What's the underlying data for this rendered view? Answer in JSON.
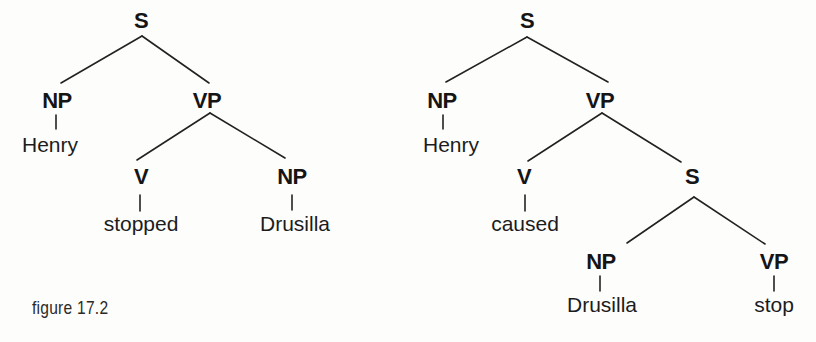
{
  "figure": {
    "caption": "figure 17.2"
  },
  "trees": [
    {
      "id": "left-tree",
      "nodes": {
        "s": {
          "label": "S"
        },
        "np": {
          "label": "NP"
        },
        "np_word": {
          "label": "Henry"
        },
        "vp": {
          "label": "VP"
        },
        "v": {
          "label": "V"
        },
        "v_word": {
          "label": "stopped"
        },
        "obj_np": {
          "label": "NP"
        },
        "obj_np_word": {
          "label": "Drusilla"
        }
      },
      "structure": "[S [NP Henry] [VP [V stopped] [NP Drusilla]]]"
    },
    {
      "id": "right-tree",
      "nodes": {
        "s": {
          "label": "S"
        },
        "np": {
          "label": "NP"
        },
        "np_word": {
          "label": "Henry"
        },
        "vp": {
          "label": "VP"
        },
        "v": {
          "label": "V"
        },
        "v_word": {
          "label": "caused"
        },
        "inner_s": {
          "label": "S"
        },
        "inner_np": {
          "label": "NP"
        },
        "inner_np_word": {
          "label": "Drusilla"
        },
        "inner_vp": {
          "label": "VP"
        },
        "inner_vp_word": {
          "label": "stop"
        }
      },
      "structure": "[S [NP Henry] [VP [V caused] [S [NP Drusilla] [VP stop]]]]"
    }
  ]
}
